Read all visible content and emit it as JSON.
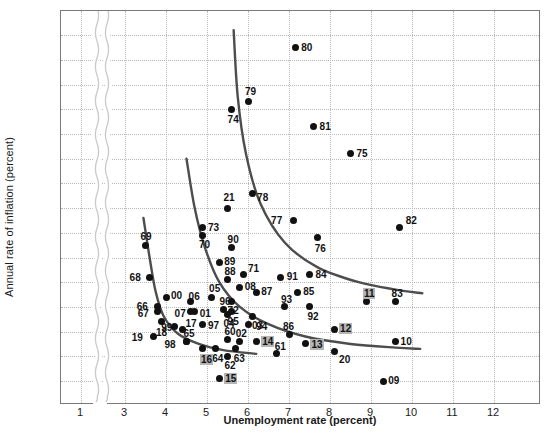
{
  "chart_data": {
    "type": "scatter",
    "title": "",
    "xlabel": "Unemployment rate (percent)",
    "ylabel": "Annual rate of inflation (percent)",
    "xlim": [
      3,
      12.6
    ],
    "ylim": [
      -1,
      14.6
    ],
    "axis_break": {
      "after": 1,
      "before": 3,
      "style": "wavy-double"
    },
    "grid": true,
    "legend": null,
    "xticks": [
      1,
      3,
      4,
      5,
      6,
      7,
      8,
      9,
      10,
      11,
      12
    ],
    "yticks": [
      -1,
      0,
      1,
      2,
      3,
      4,
      5,
      6,
      7,
      8,
      9,
      10,
      11,
      12,
      13,
      14
    ],
    "point_color": "#111111",
    "curve_color": "#4d4d4d",
    "highlight_color": "#b5b5b5",
    "highlighted_labels": [
      "11",
      "12",
      "13",
      "14",
      "15",
      "16"
    ],
    "points": [
      {
        "label": "80",
        "x": 7.15,
        "y": 13.5,
        "lx": 6,
        "ly": -6
      },
      {
        "label": "79",
        "x": 6.0,
        "y": 11.3,
        "lx": -3,
        "ly": -16
      },
      {
        "label": "74",
        "x": 5.6,
        "y": 11.0,
        "lx": -4,
        "ly": 5
      },
      {
        "label": "81",
        "x": 7.6,
        "y": 10.3,
        "lx": 6,
        "ly": -6
      },
      {
        "label": "75",
        "x": 8.5,
        "y": 9.2,
        "lx": 6,
        "ly": -6
      },
      {
        "label": "78",
        "x": 6.1,
        "y": 7.6,
        "lx": 5,
        "ly": -1
      },
      {
        "label": "21",
        "x": 5.5,
        "y": 7.0,
        "lx": -4,
        "ly": -16
      },
      {
        "label": "77",
        "x": 7.1,
        "y": 6.5,
        "lx": -22,
        "ly": -5
      },
      {
        "label": "82",
        "x": 9.7,
        "y": 6.2,
        "lx": 6,
        "ly": -13
      },
      {
        "label": "73",
        "x": 4.9,
        "y": 6.2,
        "lx": 5,
        "ly": -6
      },
      {
        "label": "70",
        "x": 4.9,
        "y": 5.9,
        "lx": -4,
        "ly": 4
      },
      {
        "label": "90",
        "x": 5.6,
        "y": 5.4,
        "lx": -4,
        "ly": -14
      },
      {
        "label": "76",
        "x": 7.7,
        "y": 5.8,
        "lx": -3,
        "ly": 5
      },
      {
        "label": "69",
        "x": 3.5,
        "y": 5.5,
        "lx": -5,
        "ly": -14
      },
      {
        "label": "89",
        "x": 5.3,
        "y": 4.8,
        "lx": 5,
        "ly": -6
      },
      {
        "label": "88",
        "x": 5.5,
        "y": 4.1,
        "lx": -3,
        "ly": -14
      },
      {
        "label": "71",
        "x": 5.9,
        "y": 4.3,
        "lx": 4,
        "ly": -12
      },
      {
        "label": "91",
        "x": 6.8,
        "y": 4.2,
        "lx": 6,
        "ly": -6
      },
      {
        "label": "84",
        "x": 7.5,
        "y": 4.3,
        "lx": 6,
        "ly": -6
      },
      {
        "label": "68",
        "x": 3.6,
        "y": 4.2,
        "lx": -20,
        "ly": -5
      },
      {
        "label": "08",
        "x": 5.8,
        "y": 3.8,
        "lx": 5,
        "ly": -6
      },
      {
        "label": "87",
        "x": 6.2,
        "y": 3.6,
        "lx": 5,
        "ly": -6
      },
      {
        "label": "05",
        "x": 5.1,
        "y": 3.4,
        "lx": -2,
        "ly": -14
      },
      {
        "label": "85",
        "x": 7.2,
        "y": 3.6,
        "lx": 6,
        "ly": -6
      },
      {
        "label": "93",
        "x": 6.9,
        "y": 3.0,
        "lx": -4,
        "ly": -13
      },
      {
        "label": "00",
        "x": 4.0,
        "y": 3.4,
        "lx": 5,
        "ly": -7
      },
      {
        "label": "06",
        "x": 4.6,
        "y": 3.2,
        "lx": -2,
        "ly": -11
      },
      {
        "label": "96",
        "x": 5.4,
        "y": 2.9,
        "lx": -4,
        "ly": -13
      },
      {
        "label": "72",
        "x": 5.6,
        "y": 3.2,
        "lx": -4,
        "ly": 3
      },
      {
        "label": "66",
        "x": 3.8,
        "y": 3.0,
        "lx": -21,
        "ly": -6
      },
      {
        "label": "07",
        "x": 4.6,
        "y": 2.8,
        "lx": -16,
        "ly": -4
      },
      {
        "label": "01",
        "x": 4.7,
        "y": 2.8,
        "lx": 5,
        "ly": -4
      },
      {
        "label": "95",
        "x": 5.6,
        "y": 2.8,
        "lx": -4,
        "ly": 4
      },
      {
        "label": "11",
        "x": 8.9,
        "y": 3.2,
        "lx": -4,
        "ly": -14,
        "highlight": true
      },
      {
        "label": "83",
        "x": 9.6,
        "y": 3.2,
        "lx": -4,
        "ly": -14
      },
      {
        "label": "67",
        "x": 3.8,
        "y": 2.8,
        "lx": -20,
        "ly": -4
      },
      {
        "label": "99",
        "x": 4.2,
        "y": 2.2,
        "lx": -13,
        "ly": -5
      },
      {
        "label": "17",
        "x": 4.4,
        "y": 2.1,
        "lx": 3,
        "ly": -11
      },
      {
        "label": "97",
        "x": 4.9,
        "y": 2.3,
        "lx": 5,
        "ly": -4
      },
      {
        "label": "04",
        "x": 5.5,
        "y": 2.7,
        "lx": -4,
        "ly": 4
      },
      {
        "label": "94",
        "x": 6.1,
        "y": 2.6,
        "lx": 4,
        "ly": 4
      },
      {
        "label": "92",
        "x": 7.5,
        "y": 3.0,
        "lx": -2,
        "ly": 4
      },
      {
        "label": "19",
        "x": 3.7,
        "y": 1.8,
        "lx": -22,
        "ly": -5
      },
      {
        "label": "18",
        "x": 3.9,
        "y": 2.4,
        "lx": -6,
        "ly": 5
      },
      {
        "label": "03",
        "x": 6.0,
        "y": 2.3,
        "lx": 4,
        "ly": -4
      },
      {
        "label": "12",
        "x": 8.1,
        "y": 2.1,
        "lx": 5,
        "ly": -6,
        "highlight": true
      },
      {
        "label": "65",
        "x": 4.5,
        "y": 1.6,
        "lx": -3,
        "ly": -13
      },
      {
        "label": "98",
        "x": 4.5,
        "y": 1.6,
        "lx": -22,
        "ly": -2
      },
      {
        "label": "64",
        "x": 5.2,
        "y": 1.3,
        "lx": -3,
        "ly": 4
      },
      {
        "label": "60",
        "x": 5.5,
        "y": 1.7,
        "lx": -3,
        "ly": -13
      },
      {
        "label": "02",
        "x": 5.8,
        "y": 1.6,
        "lx": -4,
        "ly": -13
      },
      {
        "label": "14",
        "x": 6.2,
        "y": 1.6,
        "lx": 5,
        "ly": -5,
        "highlight": true
      },
      {
        "label": "86",
        "x": 7.0,
        "y": 1.9,
        "lx": -6,
        "ly": -13
      },
      {
        "label": "13",
        "x": 7.4,
        "y": 1.5,
        "lx": 5,
        "ly": -5,
        "highlight": true
      },
      {
        "label": "10",
        "x": 9.6,
        "y": 1.6,
        "lx": 5,
        "ly": -5
      },
      {
        "label": "63",
        "x": 5.7,
        "y": 1.3,
        "lx": -2,
        "ly": 4
      },
      {
        "label": "61",
        "x": 6.7,
        "y": 1.1,
        "lx": -2,
        "ly": -13
      },
      {
        "label": "20",
        "x": 8.1,
        "y": 1.2,
        "lx": 5,
        "ly": 3
      },
      {
        "label": "62",
        "x": 5.5,
        "y": 1.0,
        "lx": -3,
        "ly": 4
      },
      {
        "label": "16",
        "x": 4.9,
        "y": 1.3,
        "lx": -3,
        "ly": 5,
        "highlight": true
      },
      {
        "label": "15",
        "x": 5.3,
        "y": 0.1,
        "lx": 5,
        "ly": -6,
        "highlight": true
      },
      {
        "label": "09",
        "x": 9.3,
        "y": 0.0,
        "lx": 5,
        "ly": -6
      }
    ],
    "curves": [
      {
        "name": "curve-1960s",
        "points": [
          [
            3.45,
            6.6
          ],
          [
            3.6,
            5.0
          ],
          [
            3.75,
            3.6
          ],
          [
            3.95,
            2.6
          ],
          [
            4.3,
            1.9
          ],
          [
            4.8,
            1.5
          ],
          [
            5.4,
            1.25
          ],
          [
            6.2,
            1.1
          ]
        ]
      },
      {
        "name": "curve-1970s",
        "points": [
          [
            4.5,
            9.0
          ],
          [
            4.7,
            7.0
          ],
          [
            4.95,
            5.4
          ],
          [
            5.3,
            4.0
          ],
          [
            5.8,
            3.0
          ],
          [
            6.5,
            2.3
          ],
          [
            7.4,
            1.8
          ],
          [
            8.5,
            1.5
          ],
          [
            9.6,
            1.35
          ],
          [
            10.2,
            1.3
          ]
        ]
      },
      {
        "name": "curve-1980s",
        "points": [
          [
            5.65,
            14.2
          ],
          [
            5.75,
            11.5
          ],
          [
            5.95,
            9.2
          ],
          [
            6.3,
            7.2
          ],
          [
            6.9,
            5.6
          ],
          [
            7.7,
            4.6
          ],
          [
            8.7,
            4.0
          ],
          [
            9.6,
            3.7
          ],
          [
            10.25,
            3.55
          ]
        ]
      }
    ]
  }
}
